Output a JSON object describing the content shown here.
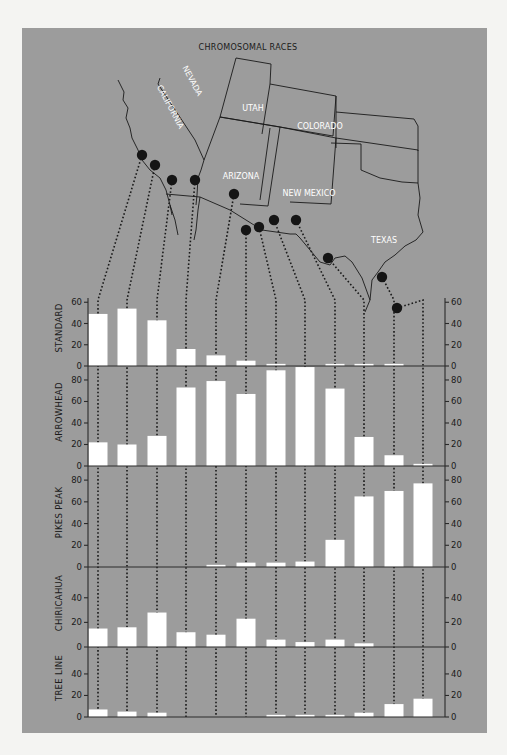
{
  "figure": {
    "title": "CHROMOSOMAL RACES",
    "colors": {
      "panel_bg": "#9c9c9c",
      "bar": "#ffffff",
      "site_dot": "#151515",
      "page_bg": "#f4f4f2"
    }
  },
  "map": {
    "state_labels": [
      {
        "name": "CALIFORNIA",
        "x": 168,
        "y": 108,
        "rotate": 62
      },
      {
        "name": "NEVADA",
        "x": 190,
        "y": 82,
        "rotate": 62
      },
      {
        "name": "UTAH",
        "x": 253,
        "y": 111,
        "rotate": 0
      },
      {
        "name": "COLORADO",
        "x": 320,
        "y": 129,
        "rotate": 0
      },
      {
        "name": "ARIZONA",
        "x": 241,
        "y": 179,
        "rotate": 0
      },
      {
        "name": "NEW MEXICO",
        "x": 309,
        "y": 196,
        "rotate": 0
      },
      {
        "name": "TEXAS",
        "x": 384,
        "y": 243,
        "rotate": 0
      }
    ],
    "sites": [
      {
        "x": 142,
        "y": 155
      },
      {
        "x": 155,
        "y": 165
      },
      {
        "x": 172,
        "y": 180
      },
      {
        "x": 195,
        "y": 180
      },
      {
        "x": 234,
        "y": 194
      },
      {
        "x": 246,
        "y": 230
      },
      {
        "x": 259,
        "y": 227
      },
      {
        "x": 274,
        "y": 220
      },
      {
        "x": 296,
        "y": 220
      },
      {
        "x": 328,
        "y": 258
      },
      {
        "x": 382,
        "y": 277
      },
      {
        "x": 397,
        "y": 308
      }
    ]
  },
  "chart_data": {
    "type": "bar",
    "title": "CHROMOSOMAL RACES",
    "xlabel": "",
    "ylabel": "Percent of population",
    "categories": [
      "Site 1",
      "Site 2",
      "Site 3",
      "Site 4",
      "Site 5",
      "Site 6",
      "Site 7",
      "Site 8",
      "Site 9",
      "Site 10",
      "Site 11",
      "Site 12"
    ],
    "grid": false,
    "legend": "none",
    "series": [
      {
        "name": "STANDARD",
        "ylim": [
          0,
          60
        ],
        "ticks": [
          0,
          20,
          40,
          60
        ],
        "values": [
          49,
          54,
          43,
          16,
          10,
          5,
          2,
          0,
          2,
          2,
          2,
          0
        ]
      },
      {
        "name": "ARROWHEAD",
        "ylim": [
          0,
          90
        ],
        "ticks": [
          0,
          20,
          40,
          60,
          80
        ],
        "values": [
          22,
          20,
          28,
          73,
          79,
          67,
          89,
          92,
          72,
          27,
          10,
          2
        ]
      },
      {
        "name": "PIKES PEAK",
        "ylim": [
          0,
          90
        ],
        "ticks": [
          0,
          20,
          40,
          60,
          80
        ],
        "values": [
          0,
          0,
          0,
          0,
          2,
          4,
          4,
          5,
          25,
          65,
          70,
          77
        ]
      },
      {
        "name": "CHIRICAHUA",
        "ylim": [
          0,
          60
        ],
        "ticks": [
          0,
          20,
          40
        ],
        "values": [
          15,
          16,
          28,
          12,
          10,
          23,
          6,
          4,
          6,
          3,
          0,
          0
        ]
      },
      {
        "name": "TREE LINE",
        "ylim": [
          0,
          60
        ],
        "ticks": [
          0,
          20,
          40
        ],
        "values": [
          7,
          5,
          4,
          0,
          0,
          0,
          2,
          2,
          2,
          4,
          12,
          17
        ]
      }
    ]
  }
}
